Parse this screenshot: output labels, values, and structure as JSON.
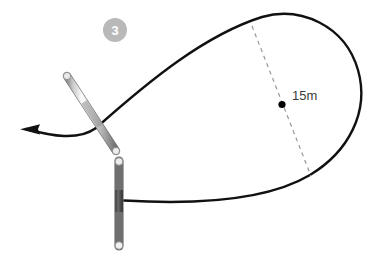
{
  "diagram": {
    "background_color": "#ffffff",
    "step_badge": {
      "number": "3",
      "fill_color": "#b9b9b9",
      "text_color": "#ffffff",
      "x": 103,
      "y": 18,
      "size": 24
    },
    "dimension": {
      "label": "15m",
      "text_color": "#3a3a3a",
      "x": 292,
      "y": 88,
      "marker_point": {
        "x": 282,
        "y": 104,
        "radius": 3.6,
        "color": "#000000"
      },
      "dashed_line": {
        "color": "#9a9a9a",
        "dash": "4 4",
        "width": 1.2,
        "from": {
          "x": 252,
          "y": 26
        },
        "to": {
          "x": 311,
          "y": 176
        }
      }
    },
    "path": {
      "name": "teardrop-loop-trajectory",
      "color": "#111111",
      "width": 2.4,
      "description": "Closed teardrop loop running from the pole out to the right and back"
    },
    "arrow": {
      "name": "direction-arrow",
      "color": "#111111",
      "tip": {
        "x": 22,
        "y": 129
      },
      "direction": "left"
    },
    "ground_line": {
      "name": "ground-line",
      "color": "#111111",
      "y": 200,
      "from_x": 45,
      "to_x": 120,
      "fade": true
    },
    "poles": [
      {
        "name": "diagonal-pole",
        "x1": 67,
        "y1": 76,
        "x2": 116,
        "y2": 151,
        "thickness": 7.5,
        "colors": {
          "edge": "#8e8e8e",
          "mid": "#f2f2f2",
          "shade": "#6f6f6f"
        }
      },
      {
        "name": "vertical-pole",
        "x1": 119,
        "y1": 160,
        "x2": 119,
        "y2": 247,
        "thickness": 8,
        "colors": {
          "edge": "#8e8e8e",
          "mid": "#f4f4f4",
          "shade": "#6f6f6f"
        },
        "band": {
          "from_y": 190,
          "to_y": 212,
          "color": "#585858"
        }
      }
    ]
  }
}
